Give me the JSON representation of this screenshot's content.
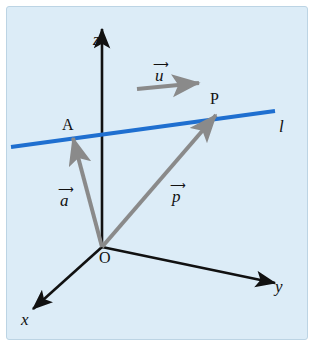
{
  "figure": {
    "type": "vector-line-diagram",
    "background_color": "#dcecf7",
    "line_color": "#1f6fd0",
    "vector_color": "#808080",
    "axis_color": "#111111",
    "caption": "",
    "axes": [
      {
        "name": "z",
        "label": "z",
        "direction": "up"
      },
      {
        "name": "y",
        "label": "y",
        "direction": "right-down"
      },
      {
        "name": "x",
        "label": "x",
        "direction": "left-down"
      }
    ],
    "points": [
      {
        "name": "origin",
        "label": "O"
      },
      {
        "name": "point-a",
        "label": "A"
      },
      {
        "name": "point-p",
        "label": "P"
      }
    ],
    "vectors": [
      {
        "name": "vector-u",
        "label": "u",
        "accent": "arrow",
        "description": "direction vector along line l"
      },
      {
        "name": "vector-a",
        "label": "a",
        "accent": "arrow",
        "description": "position vector from O to A"
      },
      {
        "name": "vector-p",
        "label": "p",
        "accent": "arrow",
        "description": "position vector from O to P"
      }
    ],
    "line": {
      "name": "line-l",
      "label": "l",
      "color": "#1f6fd0"
    }
  }
}
